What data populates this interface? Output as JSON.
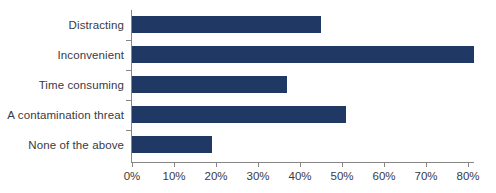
{
  "chart_data": {
    "type": "bar",
    "orientation": "horizontal",
    "title": "",
    "xlabel": "",
    "ylabel": "",
    "categories": [
      "Distracting",
      "Inconvenient",
      "Time consuming",
      "A contamination threat",
      "None of the above"
    ],
    "values": [
      45,
      81.5,
      37,
      51,
      19
    ],
    "value_suffix": "%",
    "xlim": [
      0,
      80
    ],
    "xticks": [
      0,
      10,
      20,
      30,
      40,
      50,
      60,
      70,
      80
    ],
    "xtick_labels": [
      "0%",
      "10%",
      "20%",
      "30%",
      "40%",
      "50%",
      "60%",
      "70%",
      "80%"
    ],
    "grid": false,
    "legend": false,
    "bar_color": "#1f3864",
    "axis_color": "#868686",
    "text_color": "#3a3a44"
  }
}
